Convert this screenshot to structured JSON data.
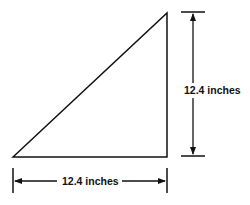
{
  "diagram": {
    "type": "right-triangle-dimensions",
    "shape": "right triangle",
    "right_angle_corner": "bottom-right",
    "colors": {
      "stroke": "#111111",
      "background": "#ffffff"
    },
    "dimensions": {
      "base": {
        "label": "12.4 inches",
        "value": 12.4,
        "unit": "inches"
      },
      "height": {
        "label": "12.4 inches",
        "value": 12.4,
        "unit": "inches"
      }
    }
  }
}
